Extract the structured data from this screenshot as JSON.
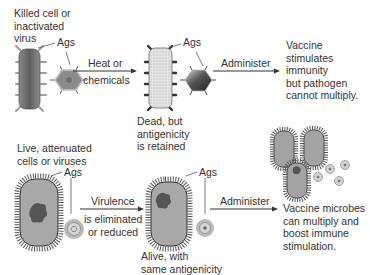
{
  "top_row": {
    "source_label": [
      "Killed cell or",
      "inactivated",
      "virus"
    ],
    "ags_label_1": "Ags",
    "process_label": [
      "Heat or",
      "chemicals"
    ],
    "ags_label_2": "Ags",
    "result_label": [
      "Dead, but",
      "antigenicity",
      "is retained"
    ],
    "administer_label": "Administer",
    "outcome_label": [
      "Vaccine",
      "stimulates",
      "immunity",
      "but pathogen",
      "cannot multiply."
    ]
  },
  "bottom_row": {
    "source_label": [
      "Live, attenuated",
      "cells or viruses"
    ],
    "ags_label_1": "Ags",
    "process_label": [
      "Virulence",
      "is eliminated",
      "or reduced"
    ],
    "ags_label_2": "Ags",
    "result_label": [
      "Alive, with",
      "same antigenicity"
    ],
    "administer_label": "Administer",
    "outcome_label": [
      "Vaccine microbes",
      "can multiply and",
      "boost immune",
      "stimulation."
    ]
  },
  "colors": {
    "cell_dark": "#6e6e6e",
    "cell_light": "#d9d9d9",
    "spike": "#9a9a9a",
    "arrow": "#333333"
  }
}
